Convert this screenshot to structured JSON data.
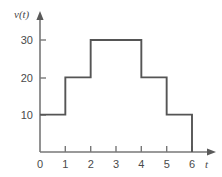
{
  "chart_data": {
    "type": "line",
    "subtype": "step",
    "title": "",
    "xlabel": "t",
    "ylabel": "v(t)",
    "xlim": [
      0,
      6.8
    ],
    "ylim": [
      0,
      36
    ],
    "grid": false,
    "legend": null,
    "x_ticks": [
      0,
      1,
      2,
      3,
      4,
      5,
      6
    ],
    "x_tick_labels": [
      "0",
      "1",
      "2",
      "3",
      "4",
      "5",
      "6"
    ],
    "y_ticks": [
      10,
      20,
      30
    ],
    "y_tick_labels": [
      "10",
      "20",
      "30"
    ],
    "line_color": "#555555",
    "axis_color": "#777777",
    "steps": [
      {
        "x_start": 0,
        "x_end": 1,
        "value": 10
      },
      {
        "x_start": 1,
        "x_end": 2,
        "value": 20
      },
      {
        "x_start": 2,
        "x_end": 4,
        "value": 30
      },
      {
        "x_start": 4,
        "x_end": 5,
        "value": 20
      },
      {
        "x_start": 5,
        "x_end": 6,
        "value": 10
      }
    ],
    "x": [
      0,
      1,
      1,
      2,
      2,
      4,
      4,
      5,
      5,
      6,
      6
    ],
    "values": [
      10,
      10,
      20,
      20,
      30,
      30,
      20,
      20,
      10,
      10,
      0
    ]
  },
  "labels": {
    "y_axis_title": "v(t)",
    "x_axis_title": "t",
    "y_tick_30": "30",
    "y_tick_20": "20",
    "y_tick_10": "10",
    "x_tick_0": "0",
    "x_tick_1": "1",
    "x_tick_2": "2",
    "x_tick_3": "3",
    "x_tick_4": "4",
    "x_tick_5": "5",
    "x_tick_6": "6"
  }
}
